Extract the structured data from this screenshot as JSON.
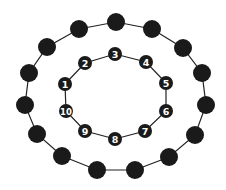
{
  "diagram": {
    "colors": {
      "node": "#1a1a1a",
      "line": "#222222",
      "label": "#ffffff",
      "background": "#ffffff"
    },
    "outer_ring": {
      "node_count": 15,
      "node_radius": 9,
      "nodes": [
        {
          "x": 116,
          "y": 22
        },
        {
          "x": 152,
          "y": 29
        },
        {
          "x": 183,
          "y": 48
        },
        {
          "x": 202,
          "y": 73
        },
        {
          "x": 206,
          "y": 105
        },
        {
          "x": 195,
          "y": 135
        },
        {
          "x": 169,
          "y": 157
        },
        {
          "x": 135,
          "y": 170
        },
        {
          "x": 97,
          "y": 170
        },
        {
          "x": 62,
          "y": 156
        },
        {
          "x": 37,
          "y": 134
        },
        {
          "x": 25,
          "y": 105
        },
        {
          "x": 29,
          "y": 73
        },
        {
          "x": 47,
          "y": 47
        },
        {
          "x": 79,
          "y": 29
        }
      ]
    },
    "inner_ring": {
      "node_count": 10,
      "node_radius": 7,
      "nodes": [
        {
          "label": "1",
          "x": 65,
          "y": 84
        },
        {
          "label": "2",
          "x": 85,
          "y": 63
        },
        {
          "label": "3",
          "x": 115,
          "y": 54
        },
        {
          "label": "4",
          "x": 146,
          "y": 62
        },
        {
          "label": "5",
          "x": 166,
          "y": 83
        },
        {
          "label": "6",
          "x": 166,
          "y": 111
        },
        {
          "label": "7",
          "x": 145,
          "y": 131
        },
        {
          "label": "8",
          "x": 115,
          "y": 139
        },
        {
          "label": "9",
          "x": 85,
          "y": 131
        },
        {
          "label": "10",
          "x": 66,
          "y": 111
        }
      ]
    }
  }
}
